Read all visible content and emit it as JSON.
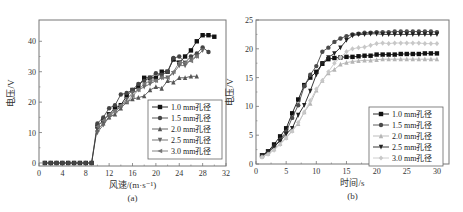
{
  "chart_data": [
    {
      "type": "line",
      "panel_label": "(a)",
      "xlabel": "风速/(m·s⁻¹)",
      "ylabel": "电压/V",
      "xlim": [
        0,
        32
      ],
      "ylim": [
        -1,
        47
      ],
      "xticks": [
        0,
        4,
        8,
        12,
        16,
        20,
        24,
        28,
        32
      ],
      "yticks": [
        0,
        10,
        20,
        30,
        40
      ],
      "legend_position": "bottom-right",
      "series": [
        {
          "name": "1.0 mm孔径",
          "marker": "square",
          "color": "#111111",
          "x": [
            1,
            2,
            3,
            4,
            5,
            6,
            7,
            8,
            9,
            10,
            11,
            12,
            13,
            14,
            15,
            16,
            17,
            18,
            19,
            20,
            21,
            22,
            23,
            24,
            25,
            26,
            27,
            28,
            29,
            30
          ],
          "y": [
            0,
            0,
            0,
            0,
            0,
            0,
            0,
            0,
            0,
            12,
            14,
            16,
            18,
            19,
            22,
            24,
            25,
            28,
            28,
            28,
            30,
            30,
            34,
            33,
            35,
            37,
            40,
            42,
            42,
            41.5
          ]
        },
        {
          "name": "1.5 mm孔径",
          "marker": "circle",
          "color": "#444444",
          "x": [
            1,
            2,
            3,
            4,
            5,
            6,
            7,
            8,
            9,
            10,
            11,
            12,
            13,
            14,
            15,
            16,
            17,
            18,
            19,
            20,
            21,
            22,
            23,
            24,
            25,
            26,
            27,
            28,
            29
          ],
          "y": [
            0,
            0,
            0,
            0,
            0,
            0,
            0,
            0,
            0,
            13,
            15,
            18,
            19,
            22.5,
            23,
            24,
            26,
            27,
            28,
            29.5,
            29,
            30,
            34.5,
            35,
            33,
            35,
            36,
            38,
            36.5
          ]
        },
        {
          "name": "2.0 mm孔径",
          "marker": "triangle-up",
          "color": "#555555",
          "x": [
            10,
            11,
            12,
            13,
            14,
            15,
            16,
            17,
            18,
            19,
            20,
            21,
            22,
            23,
            24,
            25,
            26,
            27
          ],
          "y": [
            11,
            13,
            15,
            16,
            18,
            20,
            21,
            21.5,
            22,
            24,
            25,
            24.5,
            27,
            26.5,
            28,
            28,
            28.5,
            28.5
          ]
        },
        {
          "name": "2.5 mm孔径",
          "marker": "triangle-down",
          "color": "#666666",
          "x": [
            10,
            11,
            12,
            13,
            14,
            15,
            16,
            17,
            18,
            19,
            20,
            21,
            22,
            23,
            24,
            25,
            26,
            27,
            28
          ],
          "y": [
            10,
            12.5,
            15,
            17,
            18.5,
            21,
            23,
            24,
            25,
            26,
            27,
            28,
            28,
            29.5,
            32,
            32,
            34,
            35,
            37
          ]
        },
        {
          "name": "3.0 mm孔径",
          "marker": "triangle-left",
          "color": "#777777",
          "x": [
            10,
            11,
            12,
            13,
            14,
            15,
            16,
            17,
            18,
            19,
            20,
            21,
            22,
            23,
            24,
            25,
            26,
            27
          ],
          "y": [
            12,
            14,
            16,
            17,
            19,
            20,
            22,
            24,
            26,
            27,
            27,
            28,
            28,
            30,
            33,
            33,
            33.5,
            35
          ]
        }
      ]
    },
    {
      "type": "line",
      "panel_label": "(b)",
      "xlabel": "时间/s",
      "ylabel": "电压/V",
      "xlim": [
        0,
        32
      ],
      "ylim": [
        0,
        25
      ],
      "xticks": [
        0,
        5,
        10,
        15,
        20,
        25,
        30
      ],
      "yticks": [
        0,
        5,
        10,
        15,
        20,
        25
      ],
      "legend_position": "bottom-right",
      "series": [
        {
          "name": "1.0 mm孔径",
          "marker": "square",
          "color": "#111111",
          "x": [
            1,
            2,
            3,
            4,
            5,
            6,
            7,
            8,
            9,
            10,
            11,
            12,
            13,
            14,
            15,
            16,
            17,
            18,
            19,
            20,
            21,
            22,
            23,
            24,
            25,
            26,
            27,
            28,
            29,
            30
          ],
          "y": [
            1.5,
            2.2,
            3.4,
            4.8,
            6.2,
            8.8,
            11.2,
            13.7,
            15.0,
            16.0,
            17.4,
            18.2,
            18.4,
            18.5,
            18.6,
            18.6,
            18.7,
            18.8,
            18.8,
            19.0,
            19.0,
            19.0,
            19.0,
            19.1,
            19.1,
            19.1,
            19.1,
            19.2,
            19.2,
            19.2
          ]
        },
        {
          "name": "1.5 mm孔径",
          "marker": "circle",
          "color": "#4a4a4a",
          "x": [
            1,
            2,
            3,
            4,
            5,
            6,
            7,
            8,
            9,
            10,
            11,
            12,
            13,
            14,
            15,
            16,
            17,
            18,
            19,
            20,
            21,
            22,
            23,
            24,
            25,
            26,
            27,
            28,
            29,
            30
          ],
          "y": [
            1.4,
            2.0,
            3.0,
            4.2,
            5.6,
            8.0,
            10.2,
            13.5,
            15.5,
            17.0,
            19.5,
            20.2,
            21.2,
            21.8,
            22.2,
            22.5,
            22.6,
            22.8,
            22.8,
            22.9,
            22.9,
            22.9,
            23.0,
            23.0,
            23.0,
            23.0,
            23.0,
            23.0,
            23.0,
            22.9
          ]
        },
        {
          "name": "2.0 mm孔径",
          "marker": "triangle-up",
          "color": "#b5b5b5",
          "x": [
            1,
            2,
            3,
            4,
            5,
            6,
            7,
            8,
            9,
            10,
            11,
            12,
            13,
            14,
            15,
            16,
            17,
            18,
            19,
            20,
            21,
            22,
            23,
            24,
            25,
            26,
            27,
            28,
            29,
            30
          ],
          "y": [
            1.3,
            1.8,
            2.6,
            3.5,
            4.6,
            5.8,
            7.0,
            9.0,
            10.5,
            12.8,
            14.5,
            15.8,
            16.4,
            17.3,
            17.6,
            17.8,
            17.9,
            18.0,
            18.0,
            18.1,
            18.2,
            18.2,
            18.2,
            18.2,
            18.2,
            18.2,
            18.2,
            18.2,
            18.2,
            18.2
          ]
        },
        {
          "name": "2.5 mm孔径",
          "marker": "triangle-down",
          "color": "#222222",
          "x": [
            1,
            2,
            3,
            4,
            5,
            6,
            7,
            8,
            9,
            10,
            11,
            12,
            13,
            14,
            15,
            16,
            17,
            18,
            19,
            20,
            21,
            22,
            23,
            24,
            25,
            26,
            27,
            28,
            29,
            30
          ],
          "y": [
            1.5,
            2.1,
            3.0,
            4.0,
            5.2,
            6.2,
            8.5,
            10.2,
            12.7,
            15.5,
            17.5,
            18.5,
            19.2,
            20.2,
            21.5,
            22.3,
            22.5,
            22.5,
            22.6,
            22.6,
            22.5,
            22.5,
            22.5,
            22.5,
            22.5,
            22.5,
            22.5,
            22.5,
            22.5,
            22.5
          ]
        },
        {
          "name": "3.0 mm孔径",
          "marker": "diamond",
          "color": "#c8c8c8",
          "x": [
            1,
            2,
            3,
            4,
            5,
            6,
            7,
            8,
            9,
            10,
            11,
            12,
            13,
            14,
            15,
            16,
            17,
            18,
            19,
            20,
            21,
            22,
            23,
            24,
            25,
            26,
            27,
            28,
            29,
            30
          ],
          "y": [
            1.2,
            1.7,
            2.4,
            3.4,
            4.5,
            5.7,
            7.2,
            9.0,
            11.0,
            13.0,
            14.5,
            16.0,
            17.5,
            18.5,
            19.5,
            20.0,
            20.2,
            20.3,
            20.6,
            20.9,
            21.0,
            20.9,
            21.0,
            21.0,
            21.0,
            21.0,
            21.0,
            20.9,
            20.9,
            20.9
          ]
        }
      ]
    }
  ]
}
